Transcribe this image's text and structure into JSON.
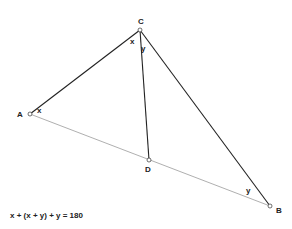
{
  "diagram": {
    "points": {
      "A": {
        "label": "A",
        "x": 30,
        "y": 114
      },
      "B": {
        "label": "B",
        "x": 270,
        "y": 206
      },
      "C": {
        "label": "C",
        "x": 140,
        "y": 30
      },
      "D": {
        "label": "D",
        "x": 149,
        "y": 160
      }
    },
    "angle_labels": {
      "x_at_C": "x",
      "y_at_C": "y",
      "x_at_A": "x",
      "y_at_B": "y"
    },
    "equation": "x + (x + y) + y = 180",
    "colors": {
      "solid_line": "#222222",
      "dotted_line": "#9a9a9a"
    }
  }
}
